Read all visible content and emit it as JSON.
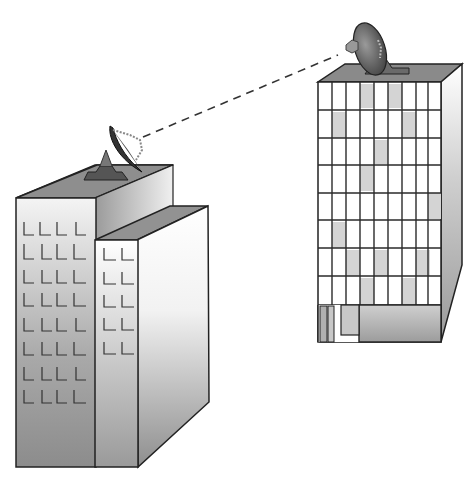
{
  "scene": {
    "description": "Illustration of two office buildings communicating via rooftop satellite dishes linked by a dashed line",
    "colors": {
      "outline": "#2a2a2a",
      "roof": "#8a8a8a",
      "dish_dark": "#4a4a4a",
      "window_tint": "#d8d8d8",
      "background": "#ffffff"
    }
  },
  "left_building": {
    "window_rows_main": 8,
    "window_cols_main": 4,
    "window_rows_annex": 5,
    "window_cols_annex": 2
  },
  "right_building": {
    "window_rows": 6,
    "window_cols": 8
  },
  "link": {
    "style": "dashed"
  }
}
